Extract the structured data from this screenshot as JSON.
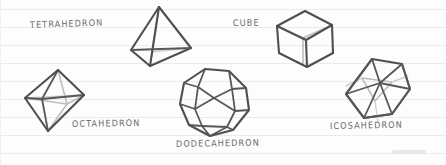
{
  "page": {
    "background_color": "#fdfdfd",
    "rule_line_color": "#e9ebee",
    "rule_line_spacing_px": 18,
    "rule_line_count": 9,
    "stroke_dark_color": "#4f4f4f",
    "stroke_hidden_color": "#bdbdbd",
    "label_color": "#6a6a6a",
    "style": "hand-drawn sketch on ruled paper"
  },
  "solids": [
    {
      "id": "tetrahedron",
      "label": "TETRAHEDRON",
      "faces": 4,
      "face_shape": "triangle",
      "label_x": 30,
      "label_y": 20,
      "label_rotate": -2,
      "shape_x": 128,
      "shape_y": 4
    },
    {
      "id": "cube",
      "label": "CUBE",
      "faces": 6,
      "face_shape": "square",
      "label_x": 233,
      "label_y": 18,
      "label_rotate": -1,
      "shape_x": 272,
      "shape_y": 8
    },
    {
      "id": "octahedron",
      "label": "OCTAHEDRON",
      "faces": 8,
      "face_shape": "triangle",
      "label_x": 72,
      "label_y": 119,
      "label_rotate": -1,
      "shape_x": 22,
      "shape_y": 66
    },
    {
      "id": "dodecahedron",
      "label": "DODECAHEDRON",
      "faces": 12,
      "face_shape": "pentagon",
      "label_x": 176,
      "label_y": 139,
      "label_rotate": -1,
      "shape_x": 177,
      "shape_y": 66
    },
    {
      "id": "icosahedron",
      "label": "ICOSAHEDRON",
      "faces": 20,
      "face_shape": "triangle",
      "label_x": 330,
      "label_y": 121,
      "label_rotate": -1,
      "shape_x": 342,
      "shape_y": 56
    }
  ]
}
